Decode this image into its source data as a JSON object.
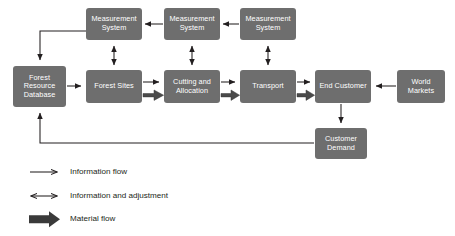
{
  "diagram": {
    "colors": {
      "box_fill": "#6e6e6e",
      "box_text": "#ffffff",
      "line": "#231f20",
      "material_flow": "#4a4a4a",
      "background": "#ffffff"
    },
    "nodes": [
      {
        "id": "measurement-system-1",
        "label": "Measurement\nSystem",
        "x": 86,
        "y": 8,
        "w": 56,
        "h": 32
      },
      {
        "id": "measurement-system-2",
        "label": "Measurement\nSystem",
        "x": 164,
        "y": 8,
        "w": 56,
        "h": 32
      },
      {
        "id": "measurement-system-3",
        "label": "Measurement\nSystem",
        "x": 240,
        "y": 8,
        "w": 56,
        "h": 32
      },
      {
        "id": "forest-resource-database",
        "label": "Forest\nResource\nDatabase",
        "x": 13,
        "y": 66,
        "w": 53,
        "h": 41
      },
      {
        "id": "forest-sites",
        "label": "Forest Sites",
        "x": 86,
        "y": 70,
        "w": 56,
        "h": 33
      },
      {
        "id": "cutting-and-allocation",
        "label": "Cutting and\nAllocation",
        "x": 164,
        "y": 70,
        "w": 56,
        "h": 33
      },
      {
        "id": "transport",
        "label": "Transport",
        "x": 240,
        "y": 70,
        "w": 56,
        "h": 33
      },
      {
        "id": "end-customer",
        "label": "End Customer",
        "x": 315,
        "y": 70,
        "w": 56,
        "h": 33
      },
      {
        "id": "world-markets",
        "label": "World\nMarkets",
        "x": 397,
        "y": 70,
        "w": 48,
        "h": 33
      },
      {
        "id": "customer-demand",
        "label": "Customer\nDemand",
        "x": 315,
        "y": 128,
        "w": 52,
        "h": 31
      }
    ],
    "legend": [
      {
        "id": "information-flow",
        "label": "Information flow",
        "marker": "single-arrow",
        "y": 168
      },
      {
        "id": "information-and-adjustment",
        "label": "Information and adjustment",
        "marker": "double-arrow",
        "y": 192
      },
      {
        "id": "material-flow",
        "label": "Material flow",
        "marker": "thick-arrow",
        "y": 215
      }
    ]
  }
}
